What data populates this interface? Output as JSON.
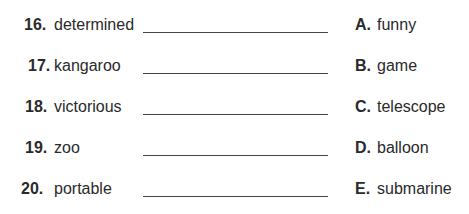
{
  "items": [
    {
      "number": "16.",
      "word": "determined",
      "letter": "A.",
      "choice": "funny"
    },
    {
      "number": "17.",
      "word": "kangaroo",
      "letter": "B.",
      "choice": "game"
    },
    {
      "number": "18.",
      "word": "victorious",
      "letter": "C.",
      "choice": "telescope"
    },
    {
      "number": "19.",
      "word": "zoo",
      "letter": "D.",
      "choice": "balloon"
    },
    {
      "number": "20.",
      "word": "portable",
      "letter": "E.",
      "choice": "submarine"
    }
  ]
}
